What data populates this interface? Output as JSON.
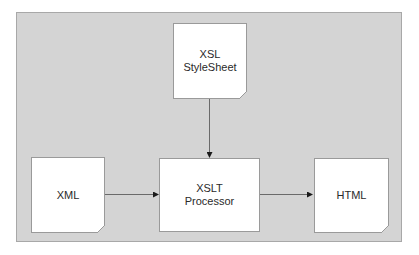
{
  "diagram": {
    "type": "flow",
    "panel_color": "#d4d4d4",
    "nodes": [
      {
        "id": "xsl",
        "label": "XSL\nStyleSheet",
        "shape": "document"
      },
      {
        "id": "xml",
        "label": "XML",
        "shape": "document"
      },
      {
        "id": "xslt",
        "label": "XSLT\nProcessor",
        "shape": "rectangle"
      },
      {
        "id": "html",
        "label": "HTML",
        "shape": "document"
      }
    ],
    "edges": [
      {
        "from": "xsl",
        "to": "xslt"
      },
      {
        "from": "xml",
        "to": "xslt"
      },
      {
        "from": "xslt",
        "to": "html"
      }
    ]
  }
}
